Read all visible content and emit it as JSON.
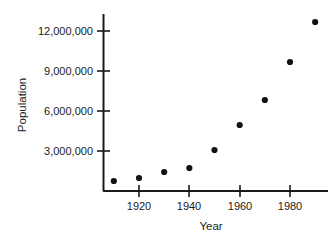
{
  "chart_data": {
    "type": "scatter",
    "title": "",
    "xlabel": "Year",
    "ylabel": "Population",
    "x": [
      1910,
      1920,
      1930,
      1940,
      1950,
      1960,
      1970,
      1980,
      1990
    ],
    "values": [
      750000,
      975000,
      1425000,
      1725000,
      3075000,
      4950000,
      6825000,
      9675000,
      12675000
    ],
    "xlim": [
      1905,
      1995
    ],
    "ylim": [
      0,
      13200000
    ],
    "xticks": [
      1920,
      1940,
      1960,
      1980
    ],
    "xtick_labels": [
      "1920",
      "1940",
      "1960",
      "1980"
    ],
    "yticks": [
      3000000,
      6000000,
      9000000,
      12000000
    ],
    "ytick_labels": [
      "3,000,000",
      "6,000,000",
      "9,000,000",
      "12,000,000"
    ],
    "grid": false,
    "legend": null,
    "marker": "filled-circle",
    "marker_color": "#111111",
    "axis_color": "#1a1a1a"
  },
  "axis_titles": {
    "x": "Year",
    "y": "Population"
  },
  "ticks": {
    "y": [
      {
        "label": "12,000,000"
      },
      {
        "label": "9,000,000"
      },
      {
        "label": "6,000,000"
      },
      {
        "label": "3,000,000"
      }
    ],
    "x": [
      {
        "label": "1920"
      },
      {
        "label": "1940"
      },
      {
        "label": "1960"
      },
      {
        "label": "1980"
      }
    ]
  }
}
